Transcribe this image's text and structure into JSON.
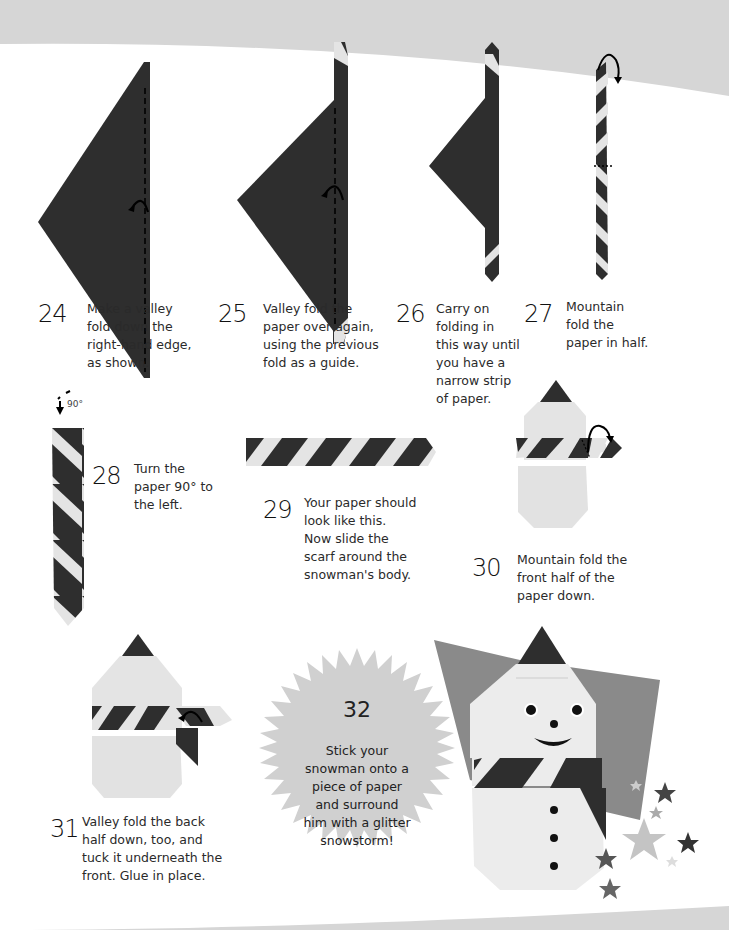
{
  "page": {
    "background_band_color": "#d6d6d6",
    "paper_dark": "#2e2e2e",
    "paper_light": "#e4e4e4",
    "backdrop_gray": "#8a8a8a"
  },
  "steps": [
    {
      "number": "24",
      "text": "Make a valley\nfold down the\nright-hand edge,\nas shown."
    },
    {
      "number": "25",
      "text": "Valley fold the\npaper over again,\nusing the previous\nfold as a guide."
    },
    {
      "number": "26",
      "text": "Carry on\nfolding in\nthis way until\nyou have a\nnarrow strip\nof paper."
    },
    {
      "number": "27",
      "text": "Mountain\nfold the\npaper in half."
    },
    {
      "number": "28",
      "text": "Turn the\npaper 90° to\nthe left."
    },
    {
      "number": "29",
      "text": "Your paper should\nlook like this.\nNow slide the\nscarf around the\nsnowman's body."
    },
    {
      "number": "30",
      "text": "Mountain fold the\nfront half of the\npaper down."
    },
    {
      "number": "31",
      "text": "Valley fold the back\nhalf down, too, and\ntuck it underneath the\nfront. Glue in place."
    },
    {
      "number": "32",
      "text": "Stick your\nsnowman onto a\npiece of paper\nand surround\nhim with a glitter\nsnowstorm!"
    }
  ],
  "rotation_label": "90°"
}
